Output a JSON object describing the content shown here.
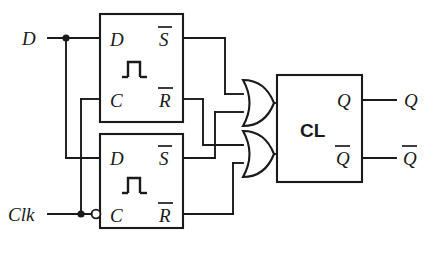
{
  "diagram": {
    "type": "digital-logic-schematic",
    "stroke_color": "#1a1a1a",
    "background_color": "#ffffff",
    "inputs": [
      {
        "id": "D",
        "label": "D",
        "x": 22,
        "y": 42
      },
      {
        "id": "Clk",
        "label": "Clk",
        "x": 12,
        "y": 218
      }
    ],
    "outputs": [
      {
        "id": "Q",
        "label": "Q",
        "x": 404,
        "y": 100
      },
      {
        "id": "Qbar",
        "label": "Q",
        "overline": true,
        "x": 404,
        "y": 158
      }
    ],
    "flipflops": [
      {
        "id": "ff-top",
        "pulse_symbol": "rising-edge-pulse",
        "clock_inverted": false,
        "pins": {
          "d_label": "D",
          "c_label": "C",
          "s_label": "S",
          "s_overline": true,
          "r_label": "R",
          "r_overline": true
        }
      },
      {
        "id": "ff-bottom",
        "pulse_symbol": "rising-edge-pulse",
        "clock_inverted": true,
        "pins": {
          "d_label": "D",
          "c_label": "C",
          "s_label": "S",
          "s_overline": true,
          "r_label": "R",
          "r_overline": true
        }
      }
    ],
    "gates": [
      {
        "id": "or-top",
        "type": "OR",
        "inputs": 2,
        "label": ""
      },
      {
        "id": "or-bottom",
        "type": "OR",
        "inputs": 2,
        "label": ""
      }
    ],
    "blocks": [
      {
        "id": "cl",
        "label": "CL",
        "description": "combinational logic block"
      }
    ]
  }
}
